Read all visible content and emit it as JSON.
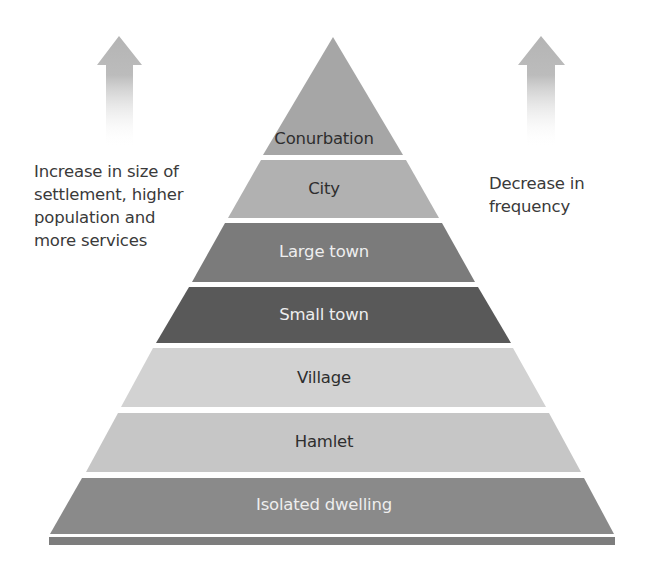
{
  "diagram": {
    "left_annotation": {
      "lines": [
        "Increase in size of",
        "settlement, higher",
        "population and",
        "more services"
      ],
      "arrow": "up-arrow-icon"
    },
    "right_annotation": {
      "lines": [
        "Decrease in",
        "frequency"
      ],
      "arrow": "up-arrow-icon"
    },
    "levels": [
      {
        "label": "Conurbation",
        "fill": "#a6a6a6",
        "text_color": "#2e2e2e"
      },
      {
        "label": "City",
        "fill": "#b1b1b1",
        "text_color": "#2e2e2e"
      },
      {
        "label": "Large town",
        "fill": "#7b7b7b",
        "text_color": "#eeeeee"
      },
      {
        "label": "Small town",
        "fill": "#595959",
        "text_color": "#eeeeee"
      },
      {
        "label": "Village",
        "fill": "#d2d2d2",
        "text_color": "#2e2e2e"
      },
      {
        "label": "Hamlet",
        "fill": "#c6c6c6",
        "text_color": "#2e2e2e"
      },
      {
        "label": "Isolated dwelling",
        "fill": "#8a8a8a",
        "text_color": "#eeeeee"
      }
    ],
    "base_strip_color": "#7d7d7d",
    "arrow_color": "#b9b9b9"
  }
}
